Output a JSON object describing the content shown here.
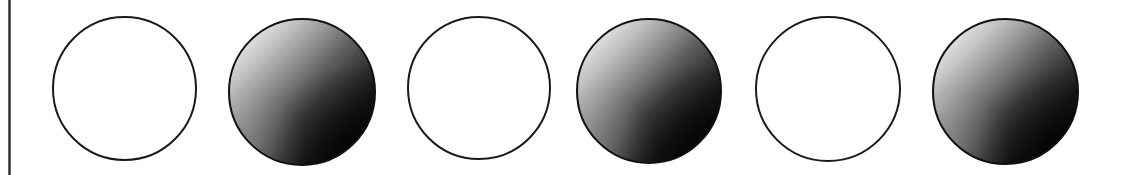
{
  "figure": {
    "type": "diagram",
    "background_color": "#ffffff",
    "width": 1127,
    "height": 175,
    "margin_rule": {
      "name": "vertical-margin-rule",
      "color": "#2b2b2b",
      "x": 8,
      "y": 0,
      "width": 3,
      "height": 175
    },
    "circles": [
      {
        "index": 1,
        "style": "outline",
        "fill": "#ffffff",
        "stroke": "#1a1a1a",
        "left": 52,
        "top": 16,
        "size": 145,
        "label": ""
      },
      {
        "index": 2,
        "style": "shaded",
        "fill_light": "#fbfbfb",
        "fill_dark": "#000000",
        "stroke": "#111111",
        "left": 228,
        "top": 18,
        "size": 148,
        "label": ""
      },
      {
        "index": 3,
        "style": "outline",
        "fill": "#ffffff",
        "stroke": "#1a1a1a",
        "left": 407,
        "top": 16,
        "size": 144,
        "label": ""
      },
      {
        "index": 4,
        "style": "shaded",
        "fill_light": "#fbfbfb",
        "fill_dark": "#000000",
        "stroke": "#111111",
        "left": 576,
        "top": 18,
        "size": 146,
        "label": ""
      },
      {
        "index": 5,
        "style": "outline",
        "fill": "#ffffff",
        "stroke": "#1a1a1a",
        "left": 755,
        "top": 16,
        "size": 146,
        "label": ""
      },
      {
        "index": 6,
        "style": "shaded",
        "fill_light": "#fbfbfb",
        "fill_dark": "#000000",
        "stroke": "#111111",
        "left": 932,
        "top": 18,
        "size": 147,
        "label": ""
      }
    ]
  }
}
